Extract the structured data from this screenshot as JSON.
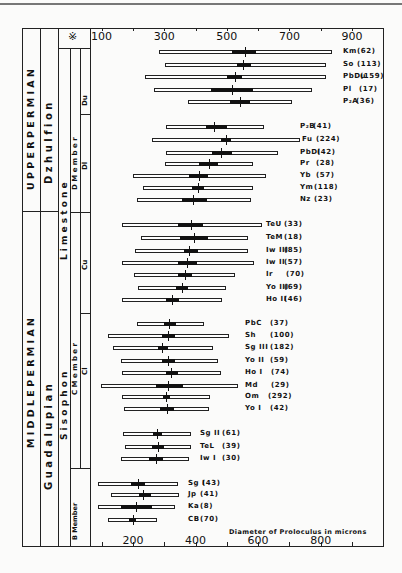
{
  "figure": {
    "header_symbol": "※",
    "stratigraphy": {
      "epochs": [
        {
          "label": "U P P E R   P E R M I A N",
          "top": 28,
          "bottom": 211
        },
        {
          "label": "M I D D L E   P E R M I A N",
          "top": 211,
          "bottom": 546
        }
      ],
      "series": [
        {
          "label": "D z h u l f i o n",
          "top": 28,
          "bottom": 211
        },
        {
          "label": "G u a d a l u p i a n",
          "top": 211,
          "bottom": 546
        }
      ],
      "formation": {
        "label_upper": "L i m e s t o n e",
        "label_lower": "S i s o p h o n"
      },
      "members": [
        {
          "label": "D   M e m b e r",
          "top": 48,
          "bottom": 212
        },
        {
          "label": "C   M e m b e r",
          "top": 212,
          "bottom": 468
        },
        {
          "label": "B Member",
          "top": 468,
          "bottom": 546
        }
      ],
      "submembers": [
        {
          "label": "Du",
          "top": 48,
          "bottom": 114
        },
        {
          "label": "Dl",
          "top": 114,
          "bottom": 212
        },
        {
          "label": "Cu",
          "top": 212,
          "bottom": 313
        },
        {
          "label": "Cl",
          "top": 313,
          "bottom": 468
        }
      ]
    }
  },
  "chart_data": {
    "type": "range-bar",
    "title": "",
    "xlabel": "Diameter of Proloculus in microns",
    "ylabel": "",
    "xlim": [
      0,
      1000
    ],
    "top_axis_ticks": [
      100,
      300,
      500,
      700,
      900
    ],
    "bottom_axis_ticks": [
      200,
      400,
      600,
      800
    ],
    "grid": false,
    "legend": "none; each bar labeled at right with sample code and (n)",
    "encoding": "white bar = observed range (min-max); black box = spread about mean; vertical tick = mean",
    "series": [
      {
        "name": "Km",
        "n": "(62)",
        "min": 283,
        "max": 836,
        "box_lo": 518,
        "box_hi": 593,
        "mean": 558,
        "y": 52,
        "lx": 343,
        "cx": 357
      },
      {
        "name": "So",
        "n": "(113)",
        "min": 303,
        "max": 817,
        "box_lo": 533,
        "box_hi": 577,
        "mean": 552,
        "y": 65,
        "lx": 343,
        "cx": 357
      },
      {
        "name": "PbDu",
        "n": "(159)",
        "min": 239,
        "max": 817,
        "box_lo": 501,
        "box_hi": 549,
        "mean": 526,
        "y": 77,
        "lx": 343,
        "cx": 360
      },
      {
        "name": "Pl",
        "n": "(17)",
        "min": 267,
        "max": 772,
        "box_lo": 449,
        "box_hi": 584,
        "mean": 517,
        "y": 90,
        "lx": 343,
        "cx": 359
      },
      {
        "name": "P₂A",
        "n": "(36)",
        "min": 376,
        "max": 708,
        "box_lo": 510,
        "box_hi": 574,
        "mean": 542,
        "y": 102,
        "lx": 343,
        "cx": 356
      },
      {
        "name": "P₂B",
        "n": "(41)",
        "min": 306,
        "max": 619,
        "box_lo": 433,
        "box_hi": 501,
        "mean": 459,
        "y": 127,
        "lx": 300,
        "cx": 313
      },
      {
        "name": "Fu",
        "n": "(224)",
        "min": 261,
        "max": 734,
        "box_lo": 482,
        "box_hi": 513,
        "mean": 497,
        "y": 140,
        "lx": 302,
        "cx": 316
      },
      {
        "name": "PbDl",
        "n": "(42)",
        "min": 306,
        "max": 664,
        "box_lo": 453,
        "box_hi": 517,
        "mean": 481,
        "y": 153,
        "lx": 300,
        "cx": 317
      },
      {
        "name": "Pr",
        "n": "(28)",
        "min": 303,
        "max": 584,
        "box_lo": 411,
        "box_hi": 472,
        "mean": 443,
        "y": 164,
        "lx": 300,
        "cx": 316
      },
      {
        "name": "Yb",
        "n": "(57)",
        "min": 200,
        "max": 625,
        "box_lo": 379,
        "box_hi": 440,
        "mean": 411,
        "y": 176,
        "lx": 300,
        "cx": 316
      },
      {
        "name": "Ym",
        "n": "(118)",
        "min": 232,
        "max": 584,
        "box_lo": 389,
        "box_hi": 427,
        "mean": 408,
        "y": 188,
        "lx": 300,
        "cx": 314
      },
      {
        "name": "Nz",
        "n": "(23)",
        "min": 213,
        "max": 577,
        "box_lo": 357,
        "box_hi": 437,
        "mean": 392,
        "y": 200,
        "lx": 300,
        "cx": 314
      },
      {
        "name": "TeU",
        "n": "(33)",
        "min": 165,
        "max": 612,
        "box_lo": 344,
        "box_hi": 424,
        "mean": 386,
        "y": 225,
        "lx": 266,
        "cx": 284
      },
      {
        "name": "TeM",
        "n": "(18)",
        "min": 226,
        "max": 568,
        "box_lo": 351,
        "box_hi": 440,
        "mean": 395,
        "y": 238,
        "lx": 266,
        "cx": 284
      },
      {
        "name": "Iw III",
        "n": "(85)",
        "min": 207,
        "max": 568,
        "box_lo": 363,
        "box_hi": 408,
        "mean": 379,
        "y": 251,
        "lx": 266,
        "cx": 284
      },
      {
        "name": "Iw II",
        "n": "(57)",
        "min": 165,
        "max": 587,
        "box_lo": 344,
        "box_hi": 405,
        "mean": 373,
        "y": 263,
        "lx": 266,
        "cx": 284
      },
      {
        "name": "Ir",
        "n": "(70)",
        "min": 204,
        "max": 526,
        "box_lo": 344,
        "box_hi": 389,
        "mean": 366,
        "y": 275,
        "lx": 266,
        "cx": 286
      },
      {
        "name": "Yo III",
        "n": "(69)",
        "min": 216,
        "max": 497,
        "box_lo": 338,
        "box_hi": 376,
        "mean": 357,
        "y": 288,
        "lx": 266,
        "cx": 284
      },
      {
        "name": "Ho II",
        "n": "(46)",
        "min": 165,
        "max": 485,
        "box_lo": 306,
        "box_hi": 347,
        "mean": 325,
        "y": 300,
        "lx": 266,
        "cx": 284
      },
      {
        "name": "PbC",
        "n": "(37)",
        "min": 213,
        "max": 427,
        "box_lo": 299,
        "box_hi": 338,
        "mean": 315,
        "y": 324,
        "lx": 245,
        "cx": 270
      },
      {
        "name": "Sh",
        "n": "(100)",
        "min": 120,
        "max": 507,
        "box_lo": 293,
        "box_hi": 334,
        "mean": 312,
        "y": 336,
        "lx": 245,
        "cx": 270
      },
      {
        "name": "Sg III",
        "n": "(182)",
        "min": 136,
        "max": 456,
        "box_lo": 280,
        "box_hi": 312,
        "mean": 293,
        "y": 348,
        "lx": 245,
        "cx": 270
      },
      {
        "name": "Yo II",
        "n": "(59)",
        "min": 162,
        "max": 472,
        "box_lo": 293,
        "box_hi": 334,
        "mean": 312,
        "y": 361,
        "lx": 245,
        "cx": 270
      },
      {
        "name": "Ho I",
        "n": "(74)",
        "min": 165,
        "max": 481,
        "box_lo": 306,
        "box_hi": 344,
        "mean": 322,
        "y": 373,
        "lx": 245,
        "cx": 271
      },
      {
        "name": "Md",
        "n": "(29)",
        "min": 98,
        "max": 536,
        "box_lo": 274,
        "box_hi": 360,
        "mean": 312,
        "y": 386,
        "lx": 245,
        "cx": 271
      },
      {
        "name": "Om",
        "n": "(292)",
        "min": 165,
        "max": 446,
        "box_lo": 296,
        "box_hi": 318,
        "mean": 306,
        "y": 397,
        "lx": 245,
        "cx": 268
      },
      {
        "name": "Yo I",
        "n": "(42)",
        "min": 172,
        "max": 443,
        "box_lo": 287,
        "box_hi": 331,
        "mean": 309,
        "y": 409,
        "lx": 245,
        "cx": 270
      },
      {
        "name": "Sg II",
        "n": "(61)",
        "min": 168,
        "max": 386,
        "box_lo": 264,
        "box_hi": 293,
        "mean": 277,
        "y": 434,
        "lx": 200,
        "cx": 222
      },
      {
        "name": "TeL",
        "n": "(39)",
        "min": 175,
        "max": 386,
        "box_lo": 261,
        "box_hi": 299,
        "mean": 280,
        "y": 447,
        "lx": 200,
        "cx": 222
      },
      {
        "name": "Iw I",
        "n": "(30)",
        "min": 162,
        "max": 379,
        "box_lo": 251,
        "box_hi": 296,
        "mean": 274,
        "y": 459,
        "lx": 200,
        "cx": 222
      },
      {
        "name": "Sg I",
        "n": "(43)",
        "min": 89,
        "max": 344,
        "box_lo": 194,
        "box_hi": 239,
        "mean": 216,
        "y": 484,
        "lx": 188,
        "cx": 202
      },
      {
        "name": "Jp",
        "n": "(41)",
        "min": 130,
        "max": 347,
        "box_lo": 219,
        "box_hi": 258,
        "mean": 232,
        "y": 495,
        "lx": 188,
        "cx": 200
      },
      {
        "name": "Ka",
        "n": "(8)",
        "min": 89,
        "max": 335,
        "box_lo": 162,
        "box_hi": 261,
        "mean": 210,
        "y": 507,
        "lx": 188,
        "cx": 200
      },
      {
        "name": "CB",
        "n": "(70)",
        "min": 120,
        "max": 277,
        "box_lo": 188,
        "box_hi": 210,
        "mean": 200,
        "y": 520,
        "lx": 188,
        "cx": 200
      }
    ]
  }
}
